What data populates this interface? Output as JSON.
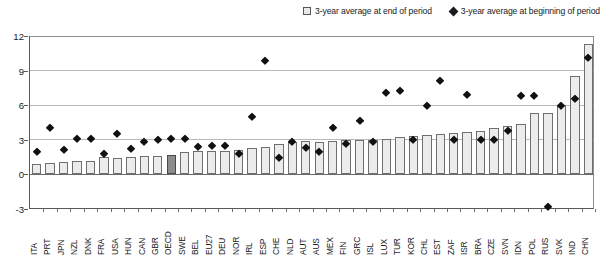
{
  "legend": {
    "items": [
      {
        "name": "bar-series",
        "marker": "square-swatch",
        "label": "3-year average at end of period"
      },
      {
        "name": "diamond-series",
        "marker": "diamond-swatch",
        "label": "3-year average at beginning of period"
      }
    ]
  },
  "axes": {
    "y_ticks": [
      "12",
      "9",
      "6",
      "3",
      "0",
      "-3"
    ],
    "y_min": -3,
    "y_max": 12,
    "x_label": "",
    "y_label": ""
  },
  "chart_data": {
    "type": "bar",
    "title": "",
    "subtitle": "",
    "xlabel": "",
    "ylabel": "",
    "ylim": [
      -3,
      12
    ],
    "yticks": [
      -3,
      0,
      3,
      6,
      9,
      12
    ],
    "grid": true,
    "legend_position": "top-right",
    "highlight_category": "OECD",
    "categories": [
      "ITA",
      "PRT",
      "JPN",
      "NZL",
      "DNK",
      "FRA",
      "USA",
      "HUN",
      "CAN",
      "GBR",
      "OECD",
      "SWE",
      "BEL",
      "EU27",
      "DEU",
      "NOR",
      "IRL",
      "ESP",
      "CHE",
      "NLD",
      "AUT",
      "AUS",
      "MEX",
      "FIN",
      "GRC",
      "ISL",
      "LUX",
      "TUR",
      "KOR",
      "CHL",
      "EST",
      "ZAF",
      "ISR",
      "BRA",
      "CZE",
      "SVN",
      "IDN",
      "POL",
      "RUS",
      "SVK",
      "IND",
      "CHN"
    ],
    "series": [
      {
        "name": "3-year average at end of period",
        "type": "bar",
        "values": [
          0.9,
          1.0,
          1.1,
          1.2,
          1.2,
          1.5,
          1.4,
          1.5,
          1.6,
          1.6,
          1.7,
          1.9,
          2.0,
          2.0,
          2.0,
          2.1,
          2.3,
          2.4,
          2.6,
          2.8,
          2.9,
          2.8,
          2.9,
          3.0,
          3.0,
          3.0,
          3.1,
          3.2,
          3.3,
          3.4,
          3.5,
          3.6,
          3.7,
          3.8,
          4.0,
          4.2,
          4.4,
          5.3,
          5.3,
          6.0,
          8.5,
          11.3
        ]
      },
      {
        "name": "3-year average at beginning of period",
        "type": "scatter",
        "marker": "diamond",
        "values": [
          1.9,
          4.0,
          2.1,
          3.1,
          3.1,
          1.8,
          3.5,
          2.2,
          2.8,
          3.0,
          3.1,
          3.1,
          2.4,
          2.5,
          2.5,
          1.8,
          5.0,
          9.8,
          1.4,
          2.8,
          2.3,
          1.9,
          4.0,
          2.6,
          4.6,
          2.8,
          7.1,
          7.2,
          3.0,
          5.9,
          8.1,
          3.0,
          6.9,
          3.0,
          3.0,
          3.8,
          6.8,
          6.8,
          -2.8,
          5.9,
          6.5,
          10.1
        ]
      }
    ]
  }
}
